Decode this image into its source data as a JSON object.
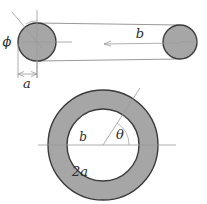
{
  "figure": {
    "caption_present": false,
    "palette": {
      "fill_gray": "#a6a6a6",
      "outline_dark": "#3b3b3b",
      "thin_line": "#8d8d8d",
      "label_color": "#2b2b2b",
      "background": "#ffffff"
    },
    "side_view": {
      "name": "torus-side-view",
      "left_circle": {
        "cx": 37,
        "cy": 42,
        "r": 19
      },
      "right_circle": {
        "cx": 180,
        "cy": 42,
        "r": 17
      },
      "labels": {
        "phi": "ϕ",
        "b": "b",
        "a": "a"
      }
    },
    "plan_view": {
      "name": "torus-plan-view",
      "center": {
        "cx": 103,
        "cy": 145
      },
      "outer_radius": 55,
      "inner_radius": 36,
      "labels": {
        "b": "b",
        "theta": "θ",
        "two_a": "2a"
      }
    }
  }
}
